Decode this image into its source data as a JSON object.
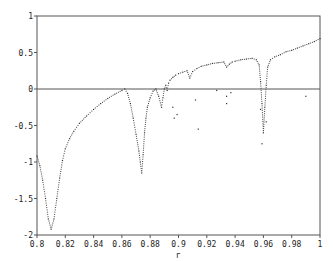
{
  "chart_data": {
    "type": "scatter",
    "title": "",
    "xlabel": "r",
    "ylabel": "",
    "xlim": [
      0.8,
      1.0
    ],
    "ylim": [
      -2,
      1
    ],
    "grid": false,
    "legend": null,
    "x_ticks": [
      "0.8",
      "0.82",
      "0.84",
      "0.86",
      "0.88",
      "0.9",
      "0.92",
      "0.94",
      "0.96",
      "0.98",
      "1"
    ],
    "y_ticks": [
      "1",
      "0.5",
      "0",
      "-0.5",
      "-1",
      "-1.5",
      "-2"
    ],
    "reference_line": {
      "y": 0
    },
    "series": [
      {
        "name": "lyapunov-exponent",
        "x": [
          0.8,
          0.802,
          0.804,
          0.806,
          0.808,
          0.81,
          0.812,
          0.814,
          0.816,
          0.818,
          0.82,
          0.823,
          0.826,
          0.83,
          0.835,
          0.84,
          0.845,
          0.85,
          0.855,
          0.86,
          0.862,
          0.864,
          0.866,
          0.868,
          0.87,
          0.872,
          0.873,
          0.874,
          0.875,
          0.876,
          0.877,
          0.878,
          0.88,
          0.882,
          0.884,
          0.886,
          0.888,
          0.889,
          0.89,
          0.891,
          0.892,
          0.893,
          0.894,
          0.896,
          0.898,
          0.9,
          0.903,
          0.906,
          0.908,
          0.91,
          0.913,
          0.916,
          0.92,
          0.924,
          0.928,
          0.932,
          0.934,
          0.936,
          0.938,
          0.94,
          0.944,
          0.948,
          0.952,
          0.955,
          0.957,
          0.958,
          0.959,
          0.96,
          0.961,
          0.962,
          0.963,
          0.965,
          0.968,
          0.972,
          0.976,
          0.98,
          0.984,
          0.988,
          0.992,
          0.996,
          1.0
        ],
        "y": [
          -0.92,
          -1.05,
          -1.25,
          -1.5,
          -1.78,
          -1.92,
          -1.78,
          -1.5,
          -1.22,
          -0.98,
          -0.82,
          -0.68,
          -0.58,
          -0.47,
          -0.37,
          -0.28,
          -0.2,
          -0.13,
          -0.07,
          -0.02,
          0.0,
          -0.06,
          -0.2,
          -0.4,
          -0.62,
          -0.85,
          -1.0,
          -1.15,
          -0.9,
          -0.6,
          -0.4,
          -0.25,
          -0.12,
          -0.03,
          0.0,
          -0.1,
          -0.25,
          -0.12,
          0.0,
          0.05,
          -0.02,
          0.08,
          0.12,
          0.16,
          0.19,
          0.21,
          0.23,
          0.25,
          0.15,
          0.24,
          0.28,
          0.31,
          0.33,
          0.35,
          0.36,
          0.37,
          0.3,
          0.34,
          0.37,
          0.38,
          0.4,
          0.41,
          0.42,
          0.4,
          0.33,
          0.1,
          -0.2,
          -0.6,
          -0.25,
          0.05,
          0.3,
          0.4,
          0.44,
          0.47,
          0.51,
          0.53,
          0.56,
          0.59,
          0.62,
          0.65,
          0.69
        ]
      },
      {
        "name": "scatter-outliers",
        "x": [
          0.896,
          0.897,
          0.899,
          0.912,
          0.914,
          0.927,
          0.934,
          0.934,
          0.937,
          0.958,
          0.959,
          0.962,
          0.99
        ],
        "y": [
          -0.25,
          -0.4,
          -0.35,
          -0.15,
          -0.55,
          -0.02,
          -0.1,
          -0.2,
          -0.05,
          -0.28,
          -0.75,
          -0.45,
          -0.1
        ]
      }
    ]
  }
}
